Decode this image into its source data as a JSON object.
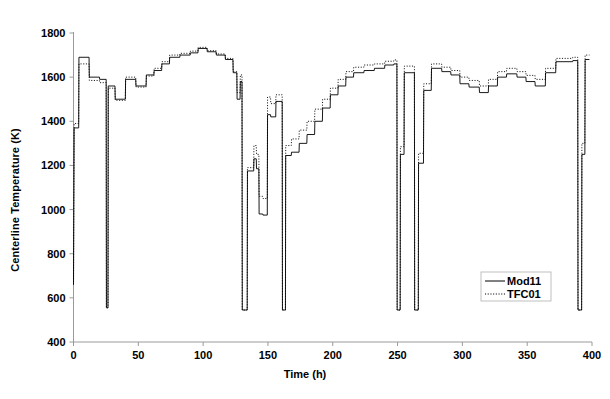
{
  "chart_data": {
    "type": "line",
    "title": "",
    "xlabel": "Time (h)",
    "ylabel": "Centerline Temperature (K)",
    "xlim": [
      0,
      400
    ],
    "ylim": [
      400,
      1800
    ],
    "xticks": [
      0,
      50,
      100,
      150,
      200,
      250,
      300,
      350,
      400
    ],
    "yticks": [
      400,
      600,
      800,
      1000,
      1200,
      1400,
      1600,
      1800
    ],
    "grid": false,
    "legend_position": "bottom-right",
    "line_style": "step",
    "series": [
      {
        "name": "Mod11",
        "style": "solid",
        "color": "#000000",
        "points": [
          [
            0.0,
            660
          ],
          [
            0.5,
            1370
          ],
          [
            4.0,
            1370
          ],
          [
            4.2,
            1690
          ],
          [
            12.0,
            1690
          ],
          [
            12.2,
            1600
          ],
          [
            20.0,
            1600
          ],
          [
            20.2,
            1590
          ],
          [
            25.2,
            1590
          ],
          [
            25.4,
            555
          ],
          [
            26.6,
            555
          ],
          [
            26.8,
            1560
          ],
          [
            32.0,
            1560
          ],
          [
            32.2,
            1500
          ],
          [
            40.0,
            1500
          ],
          [
            40.2,
            1590
          ],
          [
            48.0,
            1590
          ],
          [
            48.2,
            1560
          ],
          [
            56.0,
            1560
          ],
          [
            56.2,
            1610
          ],
          [
            62.0,
            1610
          ],
          [
            62.2,
            1630
          ],
          [
            68.0,
            1630
          ],
          [
            68.2,
            1660
          ],
          [
            74.0,
            1660
          ],
          [
            74.2,
            1690
          ],
          [
            82.0,
            1690
          ],
          [
            82.2,
            1700
          ],
          [
            90.0,
            1700
          ],
          [
            90.2,
            1710
          ],
          [
            96.0,
            1710
          ],
          [
            96.2,
            1730
          ],
          [
            103.0,
            1730
          ],
          [
            103.2,
            1715
          ],
          [
            110.0,
            1715
          ],
          [
            110.2,
            1700
          ],
          [
            117.0,
            1700
          ],
          [
            117.2,
            1680
          ],
          [
            123.0,
            1680
          ],
          [
            123.2,
            1620
          ],
          [
            126.0,
            1620
          ],
          [
            126.2,
            1500
          ],
          [
            128.5,
            1500
          ],
          [
            128.7,
            1580
          ],
          [
            130.0,
            1580
          ],
          [
            130.2,
            545
          ],
          [
            134.0,
            545
          ],
          [
            134.2,
            1175
          ],
          [
            139.0,
            1175
          ],
          [
            139.2,
            1230
          ],
          [
            141.0,
            1230
          ],
          [
            141.2,
            1185
          ],
          [
            143.0,
            1185
          ],
          [
            143.2,
            980
          ],
          [
            146.0,
            980
          ],
          [
            146.2,
            975
          ],
          [
            149.5,
            975
          ],
          [
            149.7,
            1430
          ],
          [
            152.0,
            1430
          ],
          [
            152.2,
            1420
          ],
          [
            156.0,
            1420
          ],
          [
            156.2,
            1490
          ],
          [
            161.0,
            1490
          ],
          [
            161.2,
            545
          ],
          [
            163.5,
            545
          ],
          [
            163.7,
            1245
          ],
          [
            168.0,
            1245
          ],
          [
            168.2,
            1260
          ],
          [
            174.0,
            1260
          ],
          [
            174.2,
            1300
          ],
          [
            180.0,
            1300
          ],
          [
            180.2,
            1340
          ],
          [
            186.0,
            1340
          ],
          [
            186.2,
            1400
          ],
          [
            192.0,
            1400
          ],
          [
            192.2,
            1460
          ],
          [
            198.0,
            1460
          ],
          [
            198.2,
            1520
          ],
          [
            204.0,
            1520
          ],
          [
            204.2,
            1560
          ],
          [
            210.0,
            1560
          ],
          [
            210.2,
            1600
          ],
          [
            216.0,
            1600
          ],
          [
            216.2,
            1620
          ],
          [
            224.0,
            1620
          ],
          [
            224.2,
            1630
          ],
          [
            232.0,
            1630
          ],
          [
            232.2,
            1640
          ],
          [
            240.0,
            1640
          ],
          [
            240.2,
            1655
          ],
          [
            247.0,
            1655
          ],
          [
            247.2,
            1660
          ],
          [
            249.5,
            1660
          ],
          [
            249.7,
            545
          ],
          [
            252.0,
            545
          ],
          [
            252.2,
            1250
          ],
          [
            255.0,
            1250
          ],
          [
            255.2,
            1620
          ],
          [
            263.0,
            1620
          ],
          [
            263.2,
            545
          ],
          [
            266.0,
            545
          ],
          [
            266.2,
            1210
          ],
          [
            270.0,
            1210
          ],
          [
            270.2,
            1540
          ],
          [
            276.0,
            1540
          ],
          [
            276.2,
            1640
          ],
          [
            284.0,
            1640
          ],
          [
            284.2,
            1625
          ],
          [
            291.0,
            1625
          ],
          [
            291.2,
            1610
          ],
          [
            298.0,
            1610
          ],
          [
            298.2,
            1570
          ],
          [
            305.0,
            1570
          ],
          [
            305.2,
            1555
          ],
          [
            313.0,
            1555
          ],
          [
            313.2,
            1530
          ],
          [
            320.0,
            1530
          ],
          [
            320.2,
            1560
          ],
          [
            327.0,
            1560
          ],
          [
            327.2,
            1600
          ],
          [
            334.0,
            1600
          ],
          [
            334.2,
            1615
          ],
          [
            342.0,
            1615
          ],
          [
            342.2,
            1600
          ],
          [
            349.0,
            1600
          ],
          [
            349.2,
            1580
          ],
          [
            356.0,
            1580
          ],
          [
            356.2,
            1560
          ],
          [
            364.0,
            1560
          ],
          [
            364.2,
            1620
          ],
          [
            372.0,
            1620
          ],
          [
            372.2,
            1670
          ],
          [
            385.0,
            1670
          ],
          [
            385.2,
            1675
          ],
          [
            389.0,
            1675
          ],
          [
            389.2,
            545
          ],
          [
            392.0,
            545
          ],
          [
            392.2,
            1250
          ],
          [
            394.5,
            1250
          ],
          [
            394.7,
            1680
          ],
          [
            398.0,
            1680
          ]
        ]
      },
      {
        "name": "TFC01",
        "style": "dotted",
        "color": "#000000",
        "points": [
          [
            0.0,
            660
          ],
          [
            0.5,
            1390
          ],
          [
            4.0,
            1390
          ],
          [
            4.2,
            1660
          ],
          [
            12.0,
            1660
          ],
          [
            12.2,
            1585
          ],
          [
            20.0,
            1585
          ],
          [
            20.2,
            1575
          ],
          [
            25.2,
            1575
          ],
          [
            25.4,
            555
          ],
          [
            26.6,
            555
          ],
          [
            26.8,
            1550
          ],
          [
            32.0,
            1550
          ],
          [
            32.2,
            1495
          ],
          [
            40.0,
            1495
          ],
          [
            40.2,
            1600
          ],
          [
            48.0,
            1600
          ],
          [
            48.2,
            1555
          ],
          [
            56.0,
            1555
          ],
          [
            56.2,
            1605
          ],
          [
            62.0,
            1605
          ],
          [
            62.2,
            1640
          ],
          [
            68.0,
            1640
          ],
          [
            68.2,
            1670
          ],
          [
            74.0,
            1670
          ],
          [
            74.2,
            1700
          ],
          [
            82.0,
            1700
          ],
          [
            82.2,
            1708
          ],
          [
            90.0,
            1708
          ],
          [
            90.2,
            1718
          ],
          [
            96.0,
            1718
          ],
          [
            96.2,
            1735
          ],
          [
            103.0,
            1735
          ],
          [
            103.2,
            1720
          ],
          [
            110.0,
            1720
          ],
          [
            110.2,
            1705
          ],
          [
            117.0,
            1705
          ],
          [
            117.2,
            1685
          ],
          [
            123.0,
            1685
          ],
          [
            123.2,
            1625
          ],
          [
            126.0,
            1625
          ],
          [
            126.2,
            1530
          ],
          [
            128.5,
            1530
          ],
          [
            128.7,
            1610
          ],
          [
            130.0,
            1610
          ],
          [
            130.2,
            545
          ],
          [
            134.0,
            545
          ],
          [
            134.2,
            1190
          ],
          [
            139.0,
            1190
          ],
          [
            139.2,
            1290
          ],
          [
            141.0,
            1290
          ],
          [
            141.2,
            1250
          ],
          [
            143.0,
            1250
          ],
          [
            143.2,
            1060
          ],
          [
            146.0,
            1060
          ],
          [
            146.2,
            1050
          ],
          [
            149.5,
            1050
          ],
          [
            149.7,
            1510
          ],
          [
            152.0,
            1510
          ],
          [
            152.2,
            1480
          ],
          [
            156.0,
            1480
          ],
          [
            156.2,
            1520
          ],
          [
            161.0,
            1520
          ],
          [
            161.2,
            545
          ],
          [
            163.5,
            545
          ],
          [
            163.7,
            1290
          ],
          [
            168.0,
            1290
          ],
          [
            168.2,
            1320
          ],
          [
            174.0,
            1320
          ],
          [
            174.2,
            1360
          ],
          [
            180.0,
            1360
          ],
          [
            180.2,
            1400
          ],
          [
            186.0,
            1400
          ],
          [
            186.2,
            1455
          ],
          [
            192.0,
            1455
          ],
          [
            192.2,
            1500
          ],
          [
            198.0,
            1500
          ],
          [
            198.2,
            1550
          ],
          [
            204.0,
            1550
          ],
          [
            204.2,
            1590
          ],
          [
            210.0,
            1590
          ],
          [
            210.2,
            1625
          ],
          [
            216.0,
            1625
          ],
          [
            216.2,
            1645
          ],
          [
            224.0,
            1645
          ],
          [
            224.2,
            1655
          ],
          [
            232.0,
            1655
          ],
          [
            232.2,
            1660
          ],
          [
            240.0,
            1660
          ],
          [
            240.2,
            1672
          ],
          [
            247.0,
            1672
          ],
          [
            247.2,
            1678
          ],
          [
            249.5,
            1678
          ],
          [
            249.7,
            545
          ],
          [
            252.0,
            545
          ],
          [
            252.2,
            1285
          ],
          [
            255.0,
            1285
          ],
          [
            255.2,
            1650
          ],
          [
            263.0,
            1650
          ],
          [
            263.2,
            545
          ],
          [
            266.0,
            545
          ],
          [
            266.2,
            1255
          ],
          [
            270.0,
            1255
          ],
          [
            270.2,
            1570
          ],
          [
            276.0,
            1570
          ],
          [
            276.2,
            1660
          ],
          [
            284.0,
            1660
          ],
          [
            284.2,
            1645
          ],
          [
            291.0,
            1645
          ],
          [
            291.2,
            1630
          ],
          [
            298.0,
            1630
          ],
          [
            298.2,
            1600
          ],
          [
            305.0,
            1600
          ],
          [
            305.2,
            1585
          ],
          [
            313.0,
            1585
          ],
          [
            313.2,
            1560
          ],
          [
            320.0,
            1560
          ],
          [
            320.2,
            1590
          ],
          [
            327.0,
            1590
          ],
          [
            327.2,
            1625
          ],
          [
            334.0,
            1625
          ],
          [
            334.2,
            1640
          ],
          [
            342.0,
            1640
          ],
          [
            342.2,
            1625
          ],
          [
            349.0,
            1625
          ],
          [
            349.2,
            1608
          ],
          [
            356.0,
            1608
          ],
          [
            356.2,
            1590
          ],
          [
            364.0,
            1590
          ],
          [
            364.2,
            1640
          ],
          [
            372.0,
            1640
          ],
          [
            372.2,
            1685
          ],
          [
            385.0,
            1685
          ],
          [
            385.2,
            1690
          ],
          [
            389.0,
            1690
          ],
          [
            389.2,
            545
          ],
          [
            392.0,
            545
          ],
          [
            392.2,
            1300
          ],
          [
            394.5,
            1300
          ],
          [
            394.7,
            1700
          ],
          [
            398.0,
            1700
          ]
        ]
      }
    ],
    "legend": [
      {
        "label": "Mod11",
        "style": "solid"
      },
      {
        "label": "TFC01",
        "style": "dotted"
      }
    ]
  }
}
